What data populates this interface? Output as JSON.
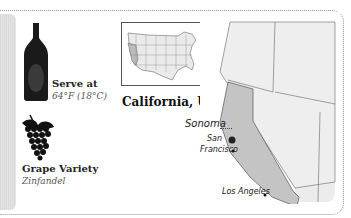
{
  "serve": {
    "label": "Serve at",
    "temperature": "64°F (18°C)"
  },
  "grape": {
    "label": "Grape Variety",
    "value": "Zinfandel"
  },
  "region": {
    "title": "California, U.S."
  },
  "map_labels": {
    "sonoma": "Sonoma",
    "san": "San",
    "francisco": "Francisco",
    "los_angeles": "Los Angeles"
  },
  "icons": [
    "wine-bottle-icon",
    "grapes-icon",
    "us-map-icon",
    "california-map"
  ],
  "colors": {
    "california": "#c4c4c4",
    "land": "#ececec",
    "bottle": "#1a1a1a"
  }
}
